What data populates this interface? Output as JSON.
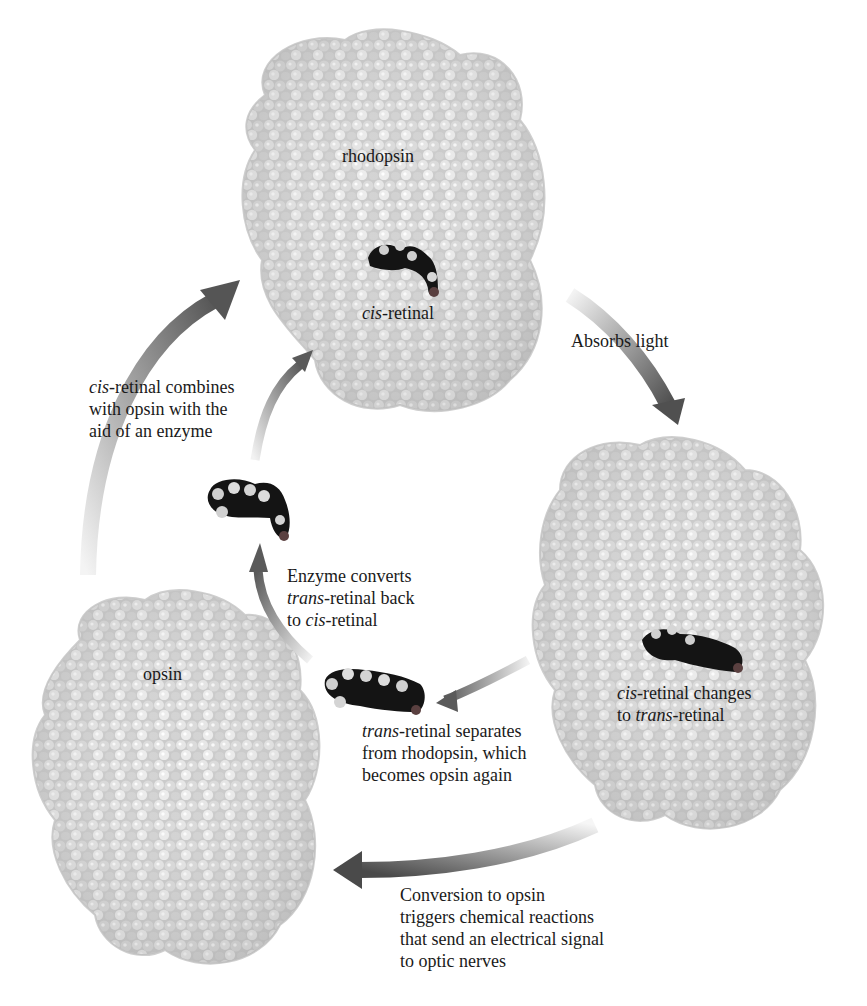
{
  "diagram": {
    "type": "cycle",
    "colors": {
      "background": "#ffffff",
      "protein": "#d6d6d6",
      "protein_shadow": "#a8a8a8",
      "retinal": "#141414",
      "arrow_dark": "#4a4a4a",
      "arrow_light": "#f2f2f2",
      "text": "#1a1a1a"
    },
    "nodes": [
      {
        "id": "rhodopsin",
        "label": "rhodopsin",
        "sublabel_italic": "cis",
        "sublabel_rest": "-retinal"
      },
      {
        "id": "activated",
        "label_lines": [
          {
            "italic": "cis",
            "rest": "-retinal changes"
          },
          {
            "prefix": "to ",
            "italic": "trans",
            "rest": "-retinal"
          }
        ]
      },
      {
        "id": "opsin",
        "label": "opsin"
      },
      {
        "id": "cis_retinal_free",
        "label": "cis-retinal molecule"
      },
      {
        "id": "trans_retinal_free",
        "label": "trans-retinal molecule"
      }
    ],
    "steps": {
      "absorbs": {
        "text": "Absorbs light"
      },
      "separates": {
        "lines": [
          {
            "italic": "trans",
            "rest": "-retinal separates"
          },
          {
            "text": "from rhodopsin, which"
          },
          {
            "text": "becomes opsin again"
          }
        ]
      },
      "enzyme_converts": {
        "lines": [
          {
            "text": "Enzyme converts"
          },
          {
            "italic": "trans",
            "rest": "-retinal back"
          },
          {
            "prefix": "to ",
            "italic": "cis",
            "rest": "-retinal"
          }
        ]
      },
      "combines": {
        "lines": [
          {
            "italic": "cis",
            "rest": "-retinal combines"
          },
          {
            "text": "with opsin with the"
          },
          {
            "text": "aid of an enzyme"
          }
        ]
      },
      "conversion": {
        "lines": [
          {
            "text": "Conversion to opsin"
          },
          {
            "text": "triggers chemical reactions"
          },
          {
            "text": "that send an electrical signal"
          },
          {
            "text": "to optic nerves"
          }
        ]
      }
    }
  }
}
